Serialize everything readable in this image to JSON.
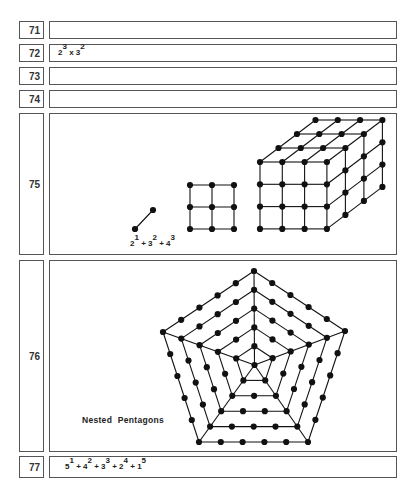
{
  "rows": [
    {
      "number": "71",
      "top": 21,
      "height": 18,
      "content": ""
    },
    {
      "number": "72",
      "top": 44,
      "height": 18,
      "content": "2^3 x 3^2"
    },
    {
      "number": "73",
      "top": 67,
      "height": 18,
      "content": ""
    },
    {
      "number": "74",
      "top": 90,
      "height": 18,
      "content": ""
    },
    {
      "number": "75",
      "top": 113,
      "height": 142,
      "content": "figure: line, square grid, cube"
    },
    {
      "number": "76",
      "top": 260,
      "height": 192,
      "content": "figure: nested pentagons"
    },
    {
      "number": "77",
      "top": 456,
      "height": 22,
      "content": "5^1 + 4^2 + 3^3 + 2^4 + 1^5"
    }
  ],
  "row72": {
    "terms": [
      {
        "base": "2",
        "exp": "3"
      },
      {
        "sep": " x "
      },
      {
        "base": "3",
        "exp": "2"
      }
    ]
  },
  "row75": {
    "formula": {
      "terms": [
        {
          "base": "2",
          "exp": "1"
        },
        {
          "sep": " + "
        },
        {
          "base": "3",
          "exp": "2"
        },
        {
          "sep": " + "
        },
        {
          "base": "4",
          "exp": "3"
        }
      ]
    },
    "line": {
      "points": [
        [
          135,
          229
        ],
        [
          153,
          210
        ]
      ]
    },
    "square": {
      "n": 3,
      "x0": 190,
      "y0": 185,
      "step": 22
    },
    "cube": {
      "n": 4,
      "x0": 260,
      "y0": 162,
      "step": 22.3,
      "dx": 18.5,
      "dy": -14
    }
  },
  "row76": {
    "caption": "Nested Pentagons",
    "pentagon": {
      "center": [
        254.5,
        365
      ],
      "outer": [
        [
          254,
          271
        ],
        [
          345,
          331
        ],
        [
          308,
          442
        ],
        [
          199,
          442
        ],
        [
          163,
          332
        ]
      ],
      "levels": 5
    }
  },
  "row77": {
    "terms": [
      {
        "base": "5",
        "exp": "1"
      },
      {
        "sep": " + "
      },
      {
        "base": "4",
        "exp": "2"
      },
      {
        "sep": " + "
      },
      {
        "base": "3",
        "exp": "3"
      },
      {
        "sep": " + "
      },
      {
        "base": "2",
        "exp": "4"
      },
      {
        "sep": " + "
      },
      {
        "base": "1",
        "exp": "5"
      }
    ]
  },
  "colors": {
    "ink": "#111111",
    "border": "#555555"
  }
}
